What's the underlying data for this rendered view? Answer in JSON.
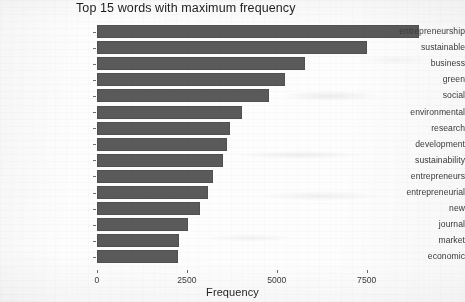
{
  "chart_data": {
    "type": "bar",
    "orientation": "horizontal",
    "title": "Top 15 words with maximum frequency",
    "xlabel": "Frequency",
    "ylabel": "",
    "xlim": [
      0,
      9400
    ],
    "xticks": [
      0,
      2500,
      5000,
      7500
    ],
    "xticklabels": [
      "0",
      "2500",
      "5000",
      "7500"
    ],
    "grid": false,
    "legend": false,
    "bar_color": "#5a5a5a",
    "background_color": "#fdfdfd",
    "categories": [
      "entrepreneurship",
      "sustainable",
      "business",
      "green",
      "social",
      "environmental",
      "research",
      "development",
      "sustainability",
      "entrepreneurs",
      "entrepreneurial",
      "new",
      "journal",
      "market",
      "economic"
    ],
    "values": [
      8960,
      7500,
      5780,
      5230,
      4770,
      4030,
      3690,
      3610,
      3500,
      3230,
      3080,
      2870,
      2520,
      2280,
      2250
    ]
  }
}
